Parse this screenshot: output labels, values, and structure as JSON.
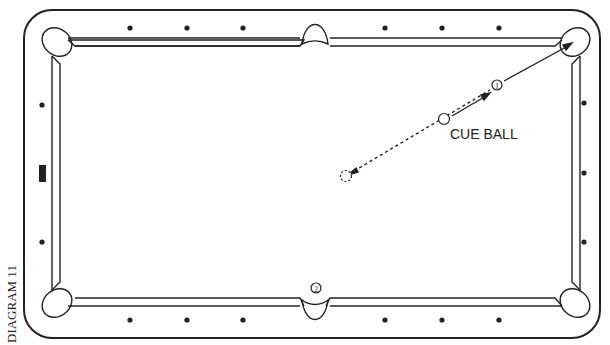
{
  "diagram": {
    "label": "DIAGRAM 11",
    "cue_ball_label": "CUE BALL",
    "ball_1_label": "1",
    "ball_2_label": "2",
    "colors": {
      "line": "#222222",
      "background": "#ffffff"
    }
  }
}
